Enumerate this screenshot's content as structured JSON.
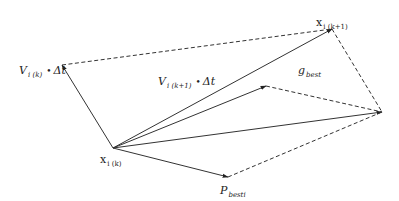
{
  "diagram": {
    "type": "vector-diagram",
    "colors": {
      "line": "#333333",
      "background": "#ffffff"
    },
    "nodes": {
      "x_k": {
        "x": 113,
        "y": 148
      },
      "v_tip": {
        "x": 62,
        "y": 65
      },
      "x_k1": {
        "x": 332,
        "y": 29
      },
      "mid_tip": {
        "x": 266,
        "y": 86
      },
      "right": {
        "x": 382,
        "y": 112
      },
      "p_best": {
        "x": 228,
        "y": 177
      }
    },
    "edges": [
      {
        "from": "x_k",
        "to": "v_tip",
        "style": "solid",
        "arrow": true
      },
      {
        "from": "x_k",
        "to": "x_k1",
        "style": "solid",
        "arrow": true
      },
      {
        "from": "x_k",
        "to": "mid_tip",
        "style": "solid",
        "arrow": true
      },
      {
        "from": "x_k",
        "to": "right",
        "style": "solid",
        "arrow": true
      },
      {
        "from": "x_k",
        "to": "p_best",
        "style": "solid",
        "arrow": true
      },
      {
        "from": "v_tip",
        "to": "x_k1",
        "style": "dashed",
        "arrow": false
      },
      {
        "from": "x_k1",
        "to": "right",
        "style": "dashed",
        "arrow": false
      },
      {
        "from": "mid_tip",
        "to": "right",
        "style": "dashed",
        "arrow": false
      },
      {
        "from": "p_best",
        "to": "right",
        "style": "dashed",
        "arrow": false
      }
    ]
  },
  "labels": {
    "v_k": {
      "main": "V",
      "sub": "i (k)",
      "suffix": "Δt",
      "dot": "•"
    },
    "v_k1": {
      "main": "V",
      "sub": "i (k+1)",
      "suffix": "Δt",
      "dot": "•"
    },
    "x_k": {
      "main": "x",
      "sub": "i (k)"
    },
    "x_k1": {
      "main": "x",
      "sub": "i (k+1)"
    },
    "g_best": {
      "main": "g",
      "sub": "best"
    },
    "p_best": {
      "main": "P",
      "sub": "besti"
    }
  }
}
